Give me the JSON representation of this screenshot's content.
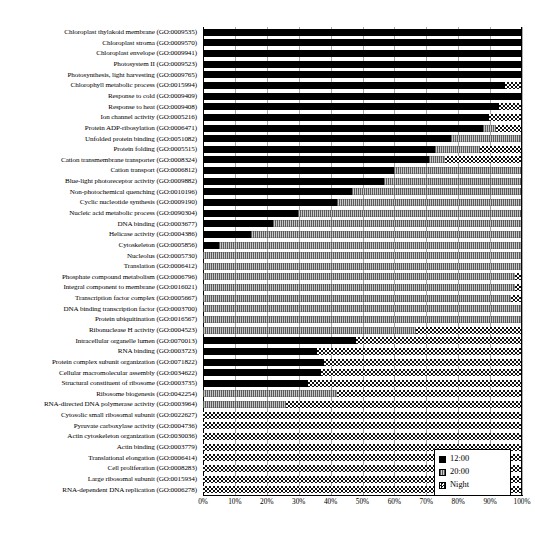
{
  "chart_data": {
    "type": "bar",
    "orientation": "horizontal",
    "stacked": true,
    "normalized": true,
    "title": "",
    "xlabel": "",
    "ylabel": "",
    "xlim": [
      0,
      100
    ],
    "grid": true,
    "legend_position": "bottom-right",
    "x_tick_labels": [
      "0%",
      "10%",
      "20%",
      "30%",
      "40%",
      "50%",
      "60%",
      "70%",
      "80%",
      "90%",
      "100%"
    ],
    "x_tick_values": [
      0,
      10,
      20,
      30,
      40,
      50,
      60,
      70,
      80,
      90,
      100
    ],
    "series": [
      {
        "name": "12:00",
        "key": "noon",
        "fill": "solid-black",
        "color": "#000000"
      },
      {
        "name": "20:00",
        "key": "evening",
        "fill": "light-gray-dotted",
        "color": "#c9c9c9"
      },
      {
        "name": "Night",
        "key": "night",
        "fill": "checkerboard",
        "color": "#ffffff"
      }
    ],
    "categories": [
      "Chloroplast thylakoid membrane (GO:0009535)",
      "Chloroplast stroma (GO:0009570)",
      "Chloroplast envelope (GO:0009941)",
      "Photosystem II (GO:0009523)",
      "Photosynthesis, light harvesting (GO:0009765)",
      "Chlorophyll metabolic process (GO:0015994)",
      "Response to cold (GO:0009409)",
      "Response to heat (GO:0009408)",
      "Ion channel activity (GO:0005216)",
      "Protein ADP-ribosylation (GO:0006471)",
      "Unfolded protein binding (GO:0051082)",
      "Protein folding (GO:0005515)",
      "Cation transmembrane transporter (GO:0008324)",
      "Cation transport (GO:0006812)",
      "Blue-light photoreceptor activity (GO:0009882)",
      "Non-photochemical quenching (GO:0010196)",
      "Cyclic nucleotide synthesis (GO:0009190)",
      "Nucleic acid metabolic process (GO:0090304)",
      "DNA binding (GO:0003677)",
      "Helicase activity (GO:0004386)",
      "Cytoskeleton (GO:0005856)",
      "Nucleolus (GO:0005730)",
      "Translation (GO:0006412)",
      "Phosphate compound metabolism (GO:0006796)",
      "Integral component to membrane (GO:0016021)",
      "Transcription factor complex (GO:0005667)",
      "DNA binding transcription factor (GO:0003700)",
      "Protein ubiquitination (GO:0016567)",
      "Ribonuclease H activity (GO:0004523)",
      "Intracellular organelle lumen (GO:0070013)",
      "RNA binding (GO:0003723)",
      "Protein complex subunit organization (GO:0071822)",
      "Cellular macromolecular assembly (GO:0034622)",
      "Structural constituent of ribosome (GO:0003735)",
      "Ribosome biogenesis (GO:0042254)",
      "RNA-directed DNA polymerase activity (GO:0003964)",
      "Cytosolic small ribosomal subunit (GO:0022627)",
      "Pyruvate carboxylase activity (GO:0004736)",
      "Actin cytoskeleton organization (GO:0030036)",
      "Actin binding (GO:0003779)",
      "Translational elongation (GO:0006414)",
      "Cell proliferation (GO:0008283)",
      "Large ribosomal subunit (GO:0015934)",
      "RNA-dependent DNA replication (GO:0006278)"
    ],
    "values": {
      "noon": [
        100,
        100,
        100,
        100,
        100,
        95,
        100,
        93,
        90,
        88,
        78,
        73,
        71,
        60,
        57,
        47,
        42,
        30,
        22,
        15,
        5,
        0,
        0,
        0,
        0,
        0,
        0,
        0,
        0,
        48,
        36,
        38,
        37,
        33,
        0,
        0,
        0,
        0,
        0,
        0,
        0,
        0,
        0,
        0
      ],
      "evening": [
        0,
        0,
        0,
        0,
        0,
        0,
        0,
        0,
        0,
        4,
        22,
        14,
        5,
        40,
        43,
        53,
        58,
        70,
        78,
        85,
        95,
        100,
        100,
        98,
        98,
        97,
        100,
        100,
        67,
        0,
        0,
        0,
        0,
        0,
        42,
        26,
        0,
        0,
        0,
        0,
        0,
        0,
        0,
        0
      ],
      "night": [
        0,
        0,
        0,
        0,
        0,
        5,
        0,
        7,
        10,
        8,
        0,
        13,
        24,
        0,
        0,
        0,
        0,
        0,
        0,
        0,
        0,
        0,
        0,
        2,
        2,
        3,
        0,
        0,
        33,
        52,
        64,
        62,
        63,
        67,
        58,
        74,
        100,
        100,
        100,
        100,
        100,
        100,
        100,
        100
      ]
    }
  },
  "legend": {
    "items": [
      {
        "label": "12:00",
        "key": "noon"
      },
      {
        "label": "20:00",
        "key": "evening"
      },
      {
        "label": "Night",
        "key": "night"
      }
    ]
  }
}
